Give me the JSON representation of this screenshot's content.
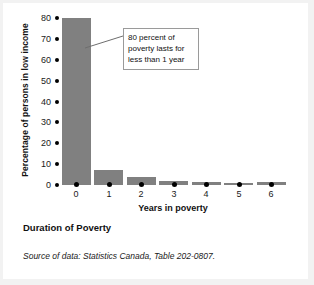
{
  "chart_data": {
    "type": "bar",
    "title": "Duration of Poverty",
    "xlabel": "Years in poverty",
    "ylabel": "Percentage of persons in low income",
    "categories": [
      "0",
      "1",
      "2",
      "3",
      "4",
      "5",
      "6"
    ],
    "values": [
      80,
      7,
      4,
      2,
      1.5,
      1,
      1.5
    ],
    "ylim": [
      0,
      80
    ],
    "yticks": [
      80,
      70,
      60,
      50,
      40,
      30,
      20,
      10,
      0
    ],
    "grid": false,
    "legend": "none",
    "bar_color": "#808080",
    "annotations": [
      {
        "name": "callout",
        "lines": [
          "80 percent of",
          "poverty lasts for",
          "less than 1 year"
        ],
        "points_to_category": "0"
      }
    ]
  },
  "figure": {
    "caption": "Duration of Poverty",
    "source": "Source of data: Statistics Canada, Table 202-0807.",
    "background": "#ffffff",
    "margin_color": "#f2f2f2"
  }
}
